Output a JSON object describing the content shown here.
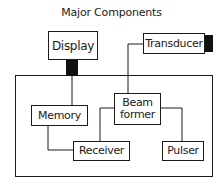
{
  "title": "Major Components",
  "components": {
    "display": "Display",
    "transducer": "Transducer",
    "memory": "Memory",
    "beamformer_line1": "Beam",
    "beamformer_line2": "former",
    "receiver": "Receiver",
    "pulser": "Pulser"
  },
  "connections": [
    {
      "from": "Display",
      "to": "Memory"
    },
    {
      "from": "Transducer",
      "to": "Beam former"
    },
    {
      "from": "Memory",
      "to": "Receiver"
    },
    {
      "from": "Beam former",
      "to": "Receiver"
    },
    {
      "from": "Beam former",
      "to": "Pulser"
    }
  ]
}
